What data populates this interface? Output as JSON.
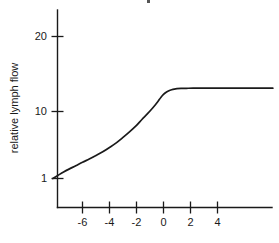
{
  "chart_data": {
    "type": "line",
    "title": "",
    "xlabel": "",
    "ylabel": "relative lymph flow",
    "yscale": "log",
    "xlim": [
      -8.2,
      8.1
    ],
    "ylim": [
      0.88,
      26
    ],
    "grid": false,
    "legend": null,
    "x_ticks": [
      -6,
      -4,
      -2,
      0,
      2,
      4
    ],
    "x_tick_labels": [
      "-6",
      "-4",
      "-2",
      "0",
      "2",
      "4"
    ],
    "y_ticks": [
      1,
      10,
      20
    ],
    "y_tick_labels": [
      "1",
      "10",
      "20"
    ],
    "series": [
      {
        "name": "relative lymph flow",
        "color": "#1a1a1a",
        "x": [
          -8.2,
          -7.8,
          -7.4,
          -7.0,
          -6.5,
          -6.0,
          -5.5,
          -5.0,
          -4.5,
          -4.0,
          -3.5,
          -3.0,
          -2.5,
          -2.0,
          -1.6,
          -1.2,
          -0.9,
          -0.6,
          -0.4,
          -0.2,
          0.0,
          0.2,
          0.4,
          0.6,
          0.8,
          1.0,
          1.3,
          1.7,
          2.2,
          3.0,
          4.0,
          5.0,
          6.0,
          7.0,
          8.1
        ],
        "y": [
          1.0,
          1.12,
          1.25,
          1.38,
          1.55,
          1.75,
          1.95,
          2.2,
          2.5,
          2.9,
          3.4,
          4.1,
          5.0,
          6.2,
          7.6,
          9.2,
          10.7,
          12.6,
          14.2,
          16.2,
          18.0,
          19.4,
          20.4,
          21.1,
          21.6,
          21.9,
          22.1,
          22.2,
          22.3,
          22.3,
          22.3,
          22.3,
          22.3,
          22.3,
          22.3
        ]
      }
    ]
  },
  "axes": {
    "y_axis_title": "relative lymph flow",
    "x_tick_labels": [
      "-6",
      "-4",
      "-2",
      "0",
      "2",
      "4"
    ],
    "y_tick_labels": [
      "20",
      "10",
      "1"
    ]
  }
}
